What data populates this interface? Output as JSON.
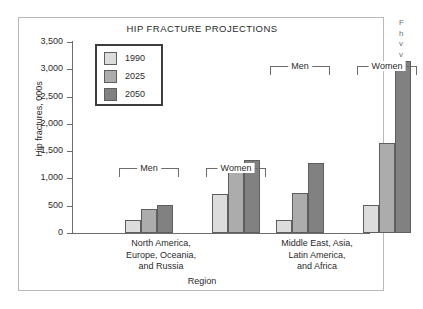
{
  "figure": {
    "title": "HIP FRACTURE PROJECTIONS",
    "x_axis_title": "Region",
    "y_axis_title": "Hip fractures, 000s"
  },
  "legend": {
    "items": [
      {
        "label": "1990",
        "color": "#dcdcdc"
      },
      {
        "label": "2025",
        "color": "#acacac"
      },
      {
        "label": "2050",
        "color": "#818181"
      }
    ]
  },
  "brackets": [
    {
      "name": "left-men",
      "label": "Men"
    },
    {
      "name": "left-women",
      "label": "Women"
    },
    {
      "name": "right-men",
      "label": "Men"
    },
    {
      "name": "right-women",
      "label": "Women"
    }
  ],
  "categories": [
    {
      "line1": "North America,",
      "line2": "Europe, Oceania,",
      "line3": "and Russia"
    },
    {
      "line1": "Middle East, Asia,",
      "line2": "Latin America,",
      "line3": "and Africa"
    }
  ],
  "y_ticks": [
    "3,500",
    "3,000",
    "2,500",
    "2,000",
    "1,500",
    "1,000",
    "500",
    "0"
  ],
  "margin_caption": {
    "line1": "F",
    "line2": "h",
    "line3": "v",
    "line4": "v"
  },
  "chart_data": {
    "type": "bar",
    "title": "HIP FRACTURE PROJECTIONS",
    "xlabel": "Region",
    "ylabel": "Hip fractures, 000s",
    "ylim": [
      0,
      3500
    ],
    "ytick_values": [
      0,
      500,
      1000,
      1500,
      2000,
      2500,
      3000,
      3500
    ],
    "ytick_labels": [
      "0",
      "500",
      "1,000",
      "1,500",
      "2,000",
      "2,500",
      "3,000",
      "3,500"
    ],
    "grid": false,
    "legend_position": "upper-left-inside",
    "series": [
      {
        "name": "1990",
        "color": "#dcdcdc"
      },
      {
        "name": "2025",
        "color": "#acacac"
      },
      {
        "name": "2050",
        "color": "#818181"
      }
    ],
    "groups": [
      {
        "region": "North America, Europe, Oceania, and Russia",
        "sex": "Men",
        "categories": [
          "1990",
          "2025",
          "2050"
        ],
        "values": [
          230,
          440,
          510
        ]
      },
      {
        "region": "North America, Europe, Oceania, and Russia",
        "sex": "Women",
        "categories": [
          "1990",
          "2025",
          "2050"
        ],
        "values": [
          710,
          1150,
          1340
        ]
      },
      {
        "region": "Middle East, Asia, Latin America, and Africa",
        "sex": "Men",
        "categories": [
          "1990",
          "2025",
          "2050"
        ],
        "values": [
          235,
          730,
          1280
        ]
      },
      {
        "region": "Middle East, Asia, Latin America, and Africa",
        "sex": "Women",
        "categories": [
          "1990",
          "2025",
          "2050"
        ],
        "values": [
          510,
          1650,
          3150
        ]
      }
    ]
  }
}
